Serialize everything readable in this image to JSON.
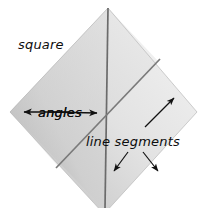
{
  "figure": {
    "background_color": "#ffffff",
    "canvas": {
      "width": 201,
      "height": 208
    }
  },
  "shape": {
    "name": "square",
    "orientation": "rotated-45-diamond",
    "fill_light": "#f2f2f2",
    "fill_mid": "#d4d4d4",
    "fill_dark": "#9a9a9a",
    "vertices": {
      "top": [
        108,
        8
      ],
      "right": [
        197,
        112
      ],
      "bottom": [
        104,
        214
      ],
      "left": [
        10,
        112
      ]
    }
  },
  "lines": {
    "vertical": {
      "name": "vertical-line-segment",
      "color": "#6b6b6b",
      "from": [
        108,
        8
      ],
      "to": [
        105,
        208
      ]
    },
    "diagonal": {
      "name": "diagonal-line-segment",
      "color": "#7a7a7a",
      "from": [
        158,
        61
      ],
      "to": [
        58,
        166
      ]
    }
  },
  "labels": {
    "square": {
      "text": "square",
      "x": 18,
      "y": 49,
      "font_size": 13
    },
    "angles": {
      "text": "angles",
      "x": 38,
      "y": 116,
      "font_size": 13
    },
    "line_segments": {
      "text": "line segments",
      "x": 86,
      "y": 145,
      "font_size": 13
    }
  },
  "arrows": {
    "color": "#111111",
    "items": [
      {
        "name": "angles-arrow-left",
        "from": [
          72,
          112
        ],
        "to": [
          18,
          112
        ],
        "direction": "left"
      },
      {
        "name": "angles-arrow-right",
        "from": [
          48,
          112
        ],
        "to": [
          101,
          113
        ],
        "direction": "right"
      },
      {
        "name": "line-segment-arrow-up-right",
        "from": [
          145,
          127
        ],
        "to": [
          175,
          97
        ],
        "direction": "up-right"
      },
      {
        "name": "line-segment-arrow-down-left",
        "from": [
          128,
          152
        ],
        "to": [
          115,
          170
        ],
        "direction": "down-left"
      },
      {
        "name": "line-segment-arrow-down-right",
        "from": [
          143,
          152
        ],
        "to": [
          158,
          170
        ],
        "direction": "down-right"
      }
    ]
  },
  "colors": {
    "stroke_dark": "#111111",
    "line_gray": "#6f6f6f",
    "text": "#0d0d0d"
  }
}
